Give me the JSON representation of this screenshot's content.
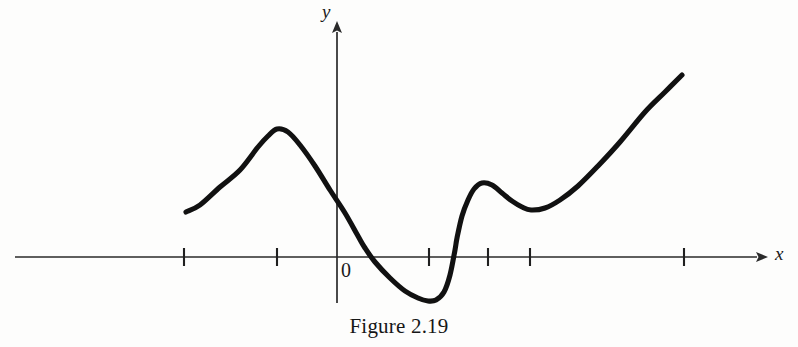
{
  "figure": {
    "caption": "Figure 2.19",
    "axis_x_label": "x",
    "axis_y_label": "y",
    "origin_label": "0",
    "colors": {
      "curve": "#111111",
      "axis": "#2a2a2a",
      "background": "#fdfdfc",
      "text": "#161616"
    }
  },
  "chart_data": {
    "type": "line",
    "title": "Figure 2.19",
    "xlabel": "x",
    "ylabel": "y",
    "grid": false,
    "legend": null,
    "axes": {
      "origin_label": "0",
      "x_axis_pixel_y": 257,
      "y_axis_pixel_x": 337,
      "x_axis_arrow": true,
      "y_axis_arrow": true,
      "x_tick_pixels": [
        184,
        277,
        429,
        488,
        530,
        684
      ],
      "x_tick_units": [
        -2.5,
        -1.5,
        0.5,
        1.1,
        1.55,
        3.2
      ],
      "tick_labels": [],
      "x_pixel_range": [
        15,
        760
      ],
      "y_pixel_range": [
        20,
        305
      ]
    },
    "units_per_pixel_x": 0.01087,
    "annotations": [
      {
        "kind": "local-maximum",
        "pixel": [
          277,
          129
        ],
        "note": "first hump peak"
      },
      {
        "kind": "x-intercept",
        "pixel": [
          365,
          257
        ],
        "note": "descending crossing"
      },
      {
        "kind": "local-minimum",
        "pixel": [
          433,
          301
        ],
        "note": "deep trough below axis"
      },
      {
        "kind": "x-intercept",
        "pixel": [
          457,
          257
        ],
        "note": "steep ascending crossing"
      },
      {
        "kind": "local-maximum",
        "pixel": [
          482,
          183
        ],
        "note": "second small hump"
      },
      {
        "kind": "local-minimum",
        "pixel": [
          531,
          210
        ],
        "note": "shallow flat plateau"
      },
      {
        "kind": "endpoint-left",
        "pixel": [
          186,
          212
        ],
        "note": "curve start"
      },
      {
        "kind": "endpoint-right",
        "pixel": [
          682,
          75
        ],
        "note": "curve end rising"
      }
    ],
    "x": [
      186,
      200,
      220,
      240,
      258,
      268,
      277,
      288,
      300,
      315,
      330,
      345,
      358,
      365,
      375,
      390,
      405,
      418,
      428,
      436,
      444,
      450,
      455,
      457,
      462,
      468,
      474,
      482,
      492,
      502,
      512,
      522,
      531,
      545,
      560,
      578,
      598,
      620,
      645,
      665,
      682
    ],
    "y": [
      212,
      205,
      187,
      170,
      147,
      136,
      129,
      132,
      145,
      166,
      190,
      213,
      236,
      248,
      262,
      278,
      291,
      298,
      301,
      300,
      292,
      275,
      250,
      238,
      216,
      200,
      189,
      183,
      185,
      193,
      201,
      207,
      210,
      208,
      200,
      186,
      166,
      142,
      112,
      92,
      75
    ]
  }
}
